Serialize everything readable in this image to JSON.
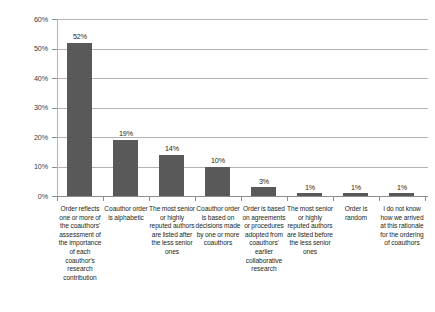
{
  "chart_data": {
    "type": "bar",
    "title": "",
    "xlabel": "",
    "ylabel": "",
    "ylim": [
      0,
      60
    ],
    "ytick_labels": [
      "0%",
      "10%",
      "20%",
      "30%",
      "40%",
      "50%",
      "60%"
    ],
    "ytick_values": [
      0,
      10,
      20,
      30,
      40,
      50,
      60
    ],
    "grid": true,
    "legend": false,
    "bar_color": "#595959",
    "gridline_color": "#b3b3b3",
    "categories": [
      "Order reflects one or more of the coauthors' assessment of the importance of each coauthor's research contribution",
      "Coauthor order is alphabetic",
      "The most senior or highly reputed authors are listed after the less senior ones",
      "Coauthor order is based on decisions made by one or more coauthors",
      "Order is based on agreements or procedures adopted from coauthors' earlier collaborative research",
      "The most senior or highly reputed authors are listed before the less senior ones",
      "Order is random",
      "I do not know how we arrived at this rationale for the ordering of coauthors"
    ],
    "values": [
      52,
      19,
      14,
      10,
      3,
      1,
      1,
      1
    ],
    "data_labels": [
      "52%",
      "19%",
      "14%",
      "10%",
      "3%",
      "1%",
      "1%",
      "1%"
    ]
  }
}
